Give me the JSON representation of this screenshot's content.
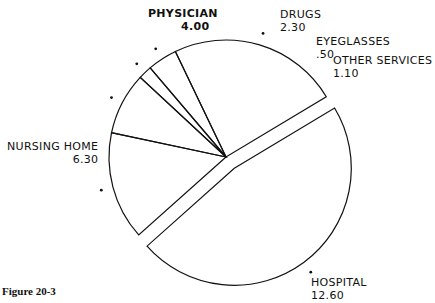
{
  "chart_data": {
    "type": "pie",
    "title": "",
    "caption": "Figure 20-3",
    "categories": [
      "Hospital",
      "Physician",
      "Drugs",
      "Eyeglasses",
      "Other Services",
      "Nursing Home"
    ],
    "values": [
      12.6,
      4.0,
      2.3,
      0.5,
      1.1,
      6.3
    ],
    "exploded": [
      "Hospital"
    ],
    "labels": [
      {
        "name": "HOSPITAL",
        "value": "12.60"
      },
      {
        "name": "PHYSICIAN",
        "value": "4.00"
      },
      {
        "name": "DRUGS",
        "value": "2.30"
      },
      {
        "name": "EYEGLASSES",
        "value": ".50"
      },
      {
        "name": "OTHER SERVICES",
        "value": "1.10"
      },
      {
        "name": "NURSING HOME",
        "value": "6.30"
      }
    ],
    "legend": "none",
    "grid": false
  },
  "caption": "Figure 20-3"
}
